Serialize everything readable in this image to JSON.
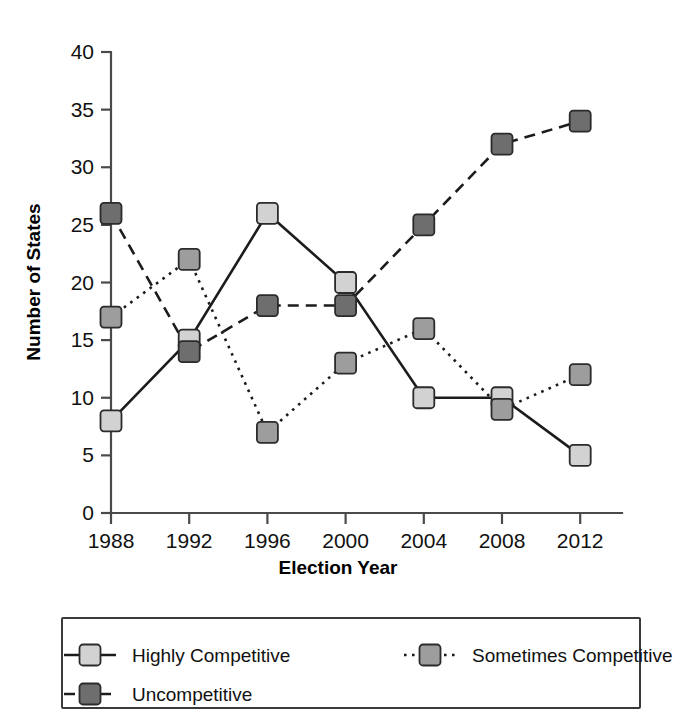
{
  "chart_data": {
    "type": "line",
    "title": "",
    "xlabel": "Election Year",
    "ylabel": "Number of States",
    "categories": [
      "1988",
      "1992",
      "1996",
      "2000",
      "2004",
      "2008",
      "2012"
    ],
    "x": [
      1988,
      1992,
      1996,
      2000,
      2004,
      2008,
      2012
    ],
    "ylim": [
      0,
      40
    ],
    "ytick_labels": [
      "0",
      "5",
      "10",
      "15",
      "20",
      "25",
      "30",
      "35",
      "40"
    ],
    "ytick_values": [
      0,
      5,
      10,
      15,
      20,
      25,
      30,
      35,
      40
    ],
    "grid": false,
    "legend_position": "below-plot",
    "series": [
      {
        "name": "Highly Competitive",
        "values": [
          8,
          15,
          26,
          20,
          10,
          10,
          5
        ],
        "line_style": "solid",
        "marker": "square",
        "color": "#d2d2d2"
      },
      {
        "name": "Sometimes Competitive",
        "values": [
          17,
          22,
          7,
          13,
          16,
          9,
          12
        ],
        "line_style": "dotted",
        "marker": "square",
        "color": "#9d9d9d"
      },
      {
        "name": "Uncompetitive",
        "values": [
          26,
          14,
          18,
          18,
          25,
          32,
          34
        ],
        "line_style": "dashed",
        "marker": "square",
        "color": "#6e6e6e"
      }
    ]
  },
  "axis": {
    "x_title": "Election Year",
    "y_title": "Number of States"
  },
  "legend": {
    "entries": [
      {
        "label": "Highly Competitive",
        "style": "solid",
        "swatch": "#d2d2d2"
      },
      {
        "label": "Sometimes Competitive",
        "style": "dotted",
        "swatch": "#9d9d9d"
      },
      {
        "label": "Uncompetitive",
        "style": "dashed",
        "swatch": "#6e6e6e"
      }
    ]
  },
  "colors": {
    "highly_competitive": "#d2d2d2",
    "sometimes_competitive": "#9d9d9d",
    "uncompetitive": "#6e6e6e",
    "axis": "#4a4a4a",
    "ink": "#1c1c1c",
    "background": "#ffffff"
  }
}
